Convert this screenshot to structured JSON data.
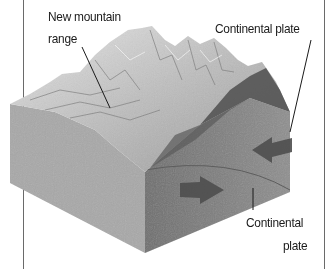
{
  "diagram": {
    "type": "geology-block-diagram",
    "labels": {
      "mountain": {
        "line1": "New mountain",
        "line2": "range"
      },
      "plate_top": "Continental plate",
      "plate_bottom": {
        "line1": "Continental",
        "line2": "plate"
      }
    },
    "arrows": [
      {
        "name": "plate-motion-arrow-left",
        "direction": "left"
      },
      {
        "name": "plate-motion-arrow-right",
        "direction": "right"
      }
    ],
    "colors": {
      "background": "#ffffff",
      "block_front": "#a9a9a9",
      "block_side": "#8a8a8a",
      "mountain_light": "#d8d8d8",
      "mountain_dark": "#5a5a5a",
      "arrow": "#4e4e4e",
      "frame": "#6a6a6a"
    }
  }
}
